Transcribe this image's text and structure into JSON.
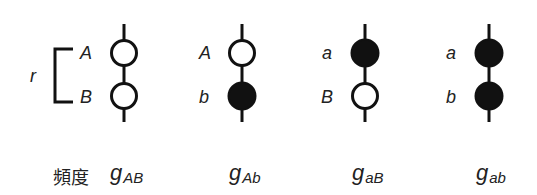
{
  "diagram": {
    "recombination_label": "r",
    "frequency_label": "頻度",
    "colors": {
      "stroke": "#111111",
      "filled": "#111111",
      "open": "#ffffff"
    },
    "chromosomes": [
      {
        "loci": [
          {
            "allele": "A",
            "filled": false
          },
          {
            "allele": "B",
            "filled": false
          }
        ],
        "freq_base": "g",
        "freq_sub": "AB"
      },
      {
        "loci": [
          {
            "allele": "A",
            "filled": false
          },
          {
            "allele": "b",
            "filled": true
          }
        ],
        "freq_base": "g",
        "freq_sub": "Ab"
      },
      {
        "loci": [
          {
            "allele": "a",
            "filled": true
          },
          {
            "allele": "B",
            "filled": false
          }
        ],
        "freq_base": "g",
        "freq_sub": "aB"
      },
      {
        "loci": [
          {
            "allele": "a",
            "filled": true
          },
          {
            "allele": "b",
            "filled": true
          }
        ],
        "freq_base": "g",
        "freq_sub": "ab"
      }
    ]
  }
}
